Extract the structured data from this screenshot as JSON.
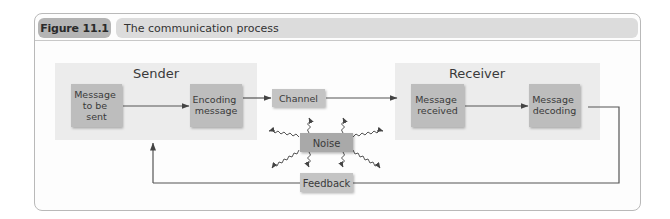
{
  "figure": {
    "number_label": "Figure 11.1",
    "title": "The communication process"
  },
  "groups": {
    "sender": "Sender",
    "receiver": "Receiver"
  },
  "nodes": {
    "message_to_be_sent": [
      "Message",
      "to be",
      "sent"
    ],
    "encoding_message": [
      "Encoding",
      "message"
    ],
    "channel": "Channel",
    "message_received": [
      "Message",
      "received"
    ],
    "message_decoding": [
      "Message",
      "decoding"
    ],
    "noise": "Noise",
    "feedback": "Feedback"
  },
  "edges": [
    {
      "from": "Message to be sent",
      "to": "Encoding message",
      "type": "arrow"
    },
    {
      "from": "Encoding message",
      "to": "Channel",
      "type": "arrow"
    },
    {
      "from": "Channel",
      "to": "Message received",
      "type": "arrow"
    },
    {
      "from": "Message received",
      "to": "Message decoding",
      "type": "arrow"
    },
    {
      "from": "Message decoding",
      "to": "Feedback",
      "type": "line"
    },
    {
      "from": "Feedback",
      "to": "Sender",
      "type": "arrow"
    },
    {
      "from": "Noise",
      "to": "Channel",
      "type": "wavy-arrow"
    },
    {
      "from": "Noise",
      "to": "Feedback",
      "type": "wavy-arrow"
    },
    {
      "from": "Noise",
      "to": "Sender",
      "type": "wavy-arrow"
    },
    {
      "from": "Noise",
      "to": "Receiver",
      "type": "wavy-arrow"
    },
    {
      "from": "Noise",
      "to": "Feedback line (left)",
      "type": "wavy-arrow"
    },
    {
      "from": "Noise",
      "to": "Feedback line (right)",
      "type": "wavy-arrow"
    }
  ],
  "colors": {
    "panel": "#ececec",
    "box": "#bdbdbd",
    "noise_box": "#a9a9a9",
    "line": "#555555",
    "header_pill": "#b4b4b4",
    "title_pill": "#dcdcdc"
  }
}
